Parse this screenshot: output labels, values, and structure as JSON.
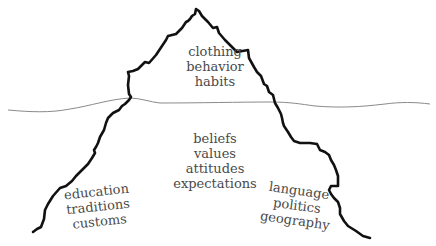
{
  "diagram": {
    "type": "iceberg-model-of-culture",
    "colors": {
      "outline": "#111111",
      "waterline": "#8a8a8a",
      "text": "#4a4a4a",
      "background": "#ffffff"
    },
    "above_water": {
      "items": [
        "clothing",
        "behavior",
        "habits"
      ]
    },
    "below_water": {
      "center": {
        "items": [
          "beliefs",
          "values",
          "attitudes",
          "expectations"
        ]
      },
      "left": {
        "items": [
          "education",
          "traditions",
          "customs"
        ]
      },
      "right": {
        "items": [
          "language",
          "politics",
          "geography"
        ]
      }
    }
  }
}
